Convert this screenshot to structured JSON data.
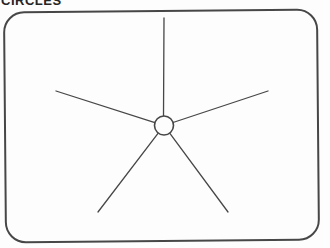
{
  "heading": {
    "text": "CIRCLES",
    "note": "cropped-at-top-edge"
  },
  "figure": {
    "canvas": {
      "width": 330,
      "height": 248
    },
    "background": "#fdfdfd",
    "ink_color": "#474747",
    "frame": {
      "x": 5,
      "y": 11,
      "width": 313,
      "height": 230,
      "corner_radius": 20,
      "stroke_width": 2,
      "rotation_deg": -0.5
    },
    "center_circle": {
      "cx": 164,
      "cy": 125.5,
      "r": 9.5,
      "stroke_width": 1.6,
      "fill": "#fdfdfd"
    },
    "spoke_stroke_width": 1.3,
    "spokes": [
      {
        "name": "top",
        "x1": 163.5,
        "y1": 116.0,
        "x2": 164,
        "y2": 18
      },
      {
        "name": "upper-left",
        "x1": 154.9,
        "y1": 122.6,
        "x2": 56,
        "y2": 91
      },
      {
        "name": "upper-right",
        "x1": 173.0,
        "y1": 122.5,
        "x2": 268,
        "y2": 91
      },
      {
        "name": "lower-left",
        "x1": 158.2,
        "y1": 133.1,
        "x2": 98,
        "y2": 212
      },
      {
        "name": "lower-right",
        "x1": 169.7,
        "y1": 133.1,
        "x2": 228,
        "y2": 212
      }
    ]
  }
}
